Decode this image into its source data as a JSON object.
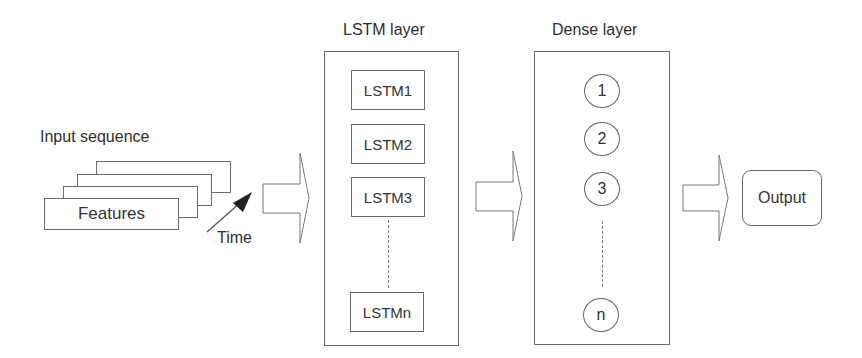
{
  "diagram": {
    "input": {
      "title": "Input sequence",
      "front_label": "Features",
      "stack_count": 4,
      "time_label": "Time"
    },
    "lstm_layer": {
      "title": "LSTM layer",
      "cells": [
        "LSTM1",
        "LSTM2",
        "LSTM3",
        "LSTMn"
      ]
    },
    "dense_layer": {
      "title": "Dense layer",
      "nodes": [
        "1",
        "2",
        "3",
        "n"
      ]
    },
    "output": {
      "label": "Output"
    },
    "colors": {
      "stroke": "#6a6a6a",
      "text": "#2e2e2e",
      "background": "#ffffff"
    }
  }
}
